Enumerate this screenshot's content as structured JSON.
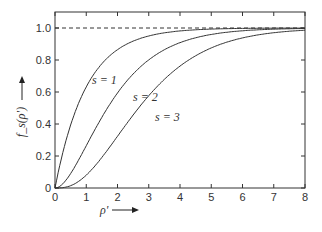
{
  "chart_data": {
    "type": "line",
    "title": "",
    "xlabel": "ρ'",
    "ylabel": "f_s(ρ')",
    "xlim": [
      0,
      8
    ],
    "ylim": [
      0,
      1.1
    ],
    "xticks": [
      "0",
      "1",
      "2",
      "3",
      "4",
      "5",
      "6",
      "7",
      "8"
    ],
    "yticks": [
      "0",
      "0.2",
      "0.4",
      "0.6",
      "0.8",
      "1.0"
    ],
    "grid": false,
    "reference_line": {
      "y": 1.0,
      "style": "dashed"
    },
    "x": [
      0,
      0.5,
      1,
      1.5,
      2,
      2.5,
      3,
      3.5,
      4,
      4.5,
      5,
      5.5,
      6,
      6.5,
      7,
      7.5,
      8
    ],
    "series": [
      {
        "name": "s = 1",
        "values": [
          0,
          0.39,
          0.63,
          0.78,
          0.86,
          0.92,
          0.95,
          0.97,
          0.98,
          0.99,
          0.99,
          1.0,
          1.0,
          1.0,
          1.0,
          1.0,
          1.0
        ]
      },
      {
        "name": "s = 2",
        "values": [
          0,
          0.09,
          0.26,
          0.44,
          0.59,
          0.71,
          0.8,
          0.86,
          0.91,
          0.94,
          0.96,
          0.97,
          0.98,
          0.99,
          0.99,
          0.99,
          1.0
        ]
      },
      {
        "name": "s = 3",
        "values": [
          0,
          0.01,
          0.08,
          0.19,
          0.32,
          0.46,
          0.58,
          0.68,
          0.76,
          0.83,
          0.88,
          0.91,
          0.94,
          0.96,
          0.97,
          0.98,
          0.99
        ]
      }
    ]
  },
  "labels": {
    "s1": "s = 1",
    "s2": "s = 2",
    "s3": "s = 3",
    "x": "ρ'",
    "y": "f_s(ρ')"
  }
}
